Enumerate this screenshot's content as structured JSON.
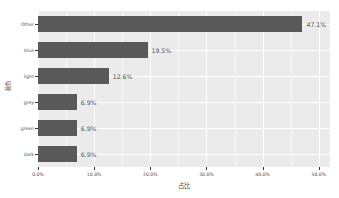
{
  "chart_data": {
    "type": "bar",
    "orientation": "horizontal",
    "title": "",
    "xlabel": "占比",
    "ylabel": "颜色",
    "categories": [
      "Other",
      "blue",
      "light",
      "grey",
      "green",
      "dark"
    ],
    "values": [
      47.1,
      19.5,
      12.6,
      6.9,
      6.9,
      6.9
    ],
    "value_labels": [
      "47.1%",
      "19.5%",
      "12.6%",
      "6.9%",
      "6.9%",
      "6.9%"
    ],
    "xlim": [
      0,
      52
    ],
    "x_tick_values": [
      0,
      10,
      20,
      30,
      40,
      50
    ],
    "x_tick_labels": [
      "0.0%",
      "10.0%",
      "20.0%",
      "30.0%",
      "40.0%",
      "50.0%"
    ],
    "x_minor_tick_values": [
      5,
      15,
      25,
      35,
      45
    ],
    "grid": true,
    "legend": "none",
    "bar_color": "#595959",
    "panel_color": "#ebebeb",
    "grid_color": "#ffffff",
    "text_color": "#4d4d4d"
  }
}
